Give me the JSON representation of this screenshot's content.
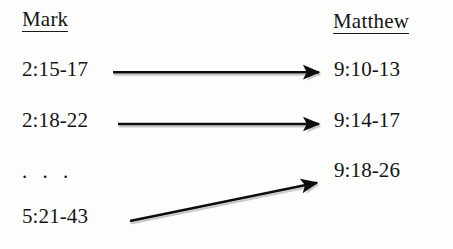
{
  "diagram": {
    "type": "correspondence-mapping",
    "columns": {
      "left": {
        "header": "Mark",
        "entries": [
          {
            "id": "mark-p1",
            "label": "2:15-17"
          },
          {
            "id": "mark-p2",
            "label": "2:18-22"
          },
          {
            "id": "mark-ellipsis",
            "label": ". . ."
          },
          {
            "id": "mark-p3",
            "label": "5:21-43"
          }
        ]
      },
      "right": {
        "header": "Matthew",
        "entries": [
          {
            "id": "matt-p1",
            "label": "9:10-13"
          },
          {
            "id": "matt-p2",
            "label": "9:14-17"
          },
          {
            "id": "matt-p3",
            "label": "9:18-26"
          }
        ]
      }
    },
    "arrows": [
      {
        "id": "arrow-1",
        "from": "2:15-17",
        "to": "9:10-13",
        "style": "horizontal"
      },
      {
        "id": "arrow-2",
        "from": "2:18-22",
        "to": "9:14-17",
        "style": "horizontal"
      },
      {
        "id": "arrow-3",
        "from": "5:21-43",
        "to": "9:18-26",
        "style": "diagonal"
      }
    ]
  },
  "colors": {
    "background": "#fdfdfc",
    "text": "#141414",
    "arrow": "#0d0d0d",
    "arrow_shadow": "#c9c9c9",
    "rule": "#1a1a1a"
  }
}
